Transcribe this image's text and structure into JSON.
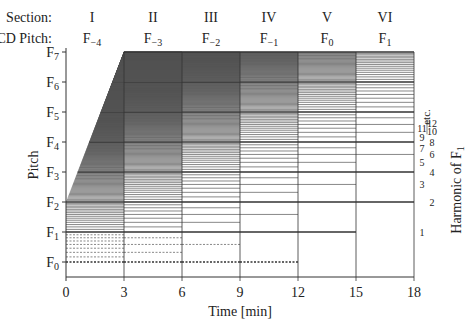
{
  "header": {
    "section_label": "Section:",
    "gcd_label": "GCD Pitch:",
    "sections": [
      {
        "numeral": "I",
        "gcd_base": "F",
        "gcd_sub": "−4"
      },
      {
        "numeral": "II",
        "gcd_base": "F",
        "gcd_sub": "−3"
      },
      {
        "numeral": "III",
        "gcd_base": "F",
        "gcd_sub": "−2"
      },
      {
        "numeral": "IV",
        "gcd_base": "F",
        "gcd_sub": "−1"
      },
      {
        "numeral": "V",
        "gcd_base": "F",
        "gcd_sub": "0"
      },
      {
        "numeral": "VI",
        "gcd_base": "F",
        "gcd_sub": "1"
      }
    ]
  },
  "axes": {
    "x_label": "Time [min]",
    "x_ticks": [
      "0",
      "3",
      "6",
      "9",
      "12",
      "15",
      "18"
    ],
    "y_label": "Pitch",
    "y_ticks": [
      {
        "base": "F",
        "sub": "0"
      },
      {
        "base": "F",
        "sub": "1"
      },
      {
        "base": "F",
        "sub": "2"
      },
      {
        "base": "F",
        "sub": "3"
      },
      {
        "base": "F",
        "sub": "4"
      },
      {
        "base": "F",
        "sub": "5"
      },
      {
        "base": "F",
        "sub": "6"
      },
      {
        "base": "F",
        "sub": "7"
      }
    ],
    "right_label_base": "Harmonic of F",
    "right_label_sub": "1",
    "harmonic_labels": [
      "1",
      "2",
      "3",
      "4",
      "5",
      "6",
      "7",
      "8",
      "9",
      "10",
      "11",
      "12"
    ],
    "etc_label": "etc."
  },
  "chart_data": {
    "type": "diagram",
    "title": "",
    "xlabel": "Time [min]",
    "ylabel": "Pitch",
    "xlim": [
      0,
      18
    ],
    "ylim": [
      "F0",
      "F7"
    ],
    "sections": [
      {
        "name": "I",
        "start_min": 0,
        "end_min": 3,
        "gcd_pitch": "F-4",
        "octave_offset": -4
      },
      {
        "name": "II",
        "start_min": 3,
        "end_min": 6,
        "gcd_pitch": "F-3",
        "octave_offset": -3
      },
      {
        "name": "III",
        "start_min": 6,
        "end_min": 9,
        "gcd_pitch": "F-2",
        "octave_offset": -2
      },
      {
        "name": "IV",
        "start_min": 9,
        "end_min": 12,
        "gcd_pitch": "F-1",
        "octave_offset": -1
      },
      {
        "name": "V",
        "start_min": 12,
        "end_min": 15,
        "gcd_pitch": "F0",
        "octave_offset": 0
      },
      {
        "name": "VI",
        "start_min": 15,
        "end_min": 18,
        "gcd_pitch": "F1",
        "octave_offset": 1
      }
    ]
  },
  "style": {
    "line_color": "#555555",
    "axis_color": "#333333",
    "strong_line_color": "#333333"
  }
}
